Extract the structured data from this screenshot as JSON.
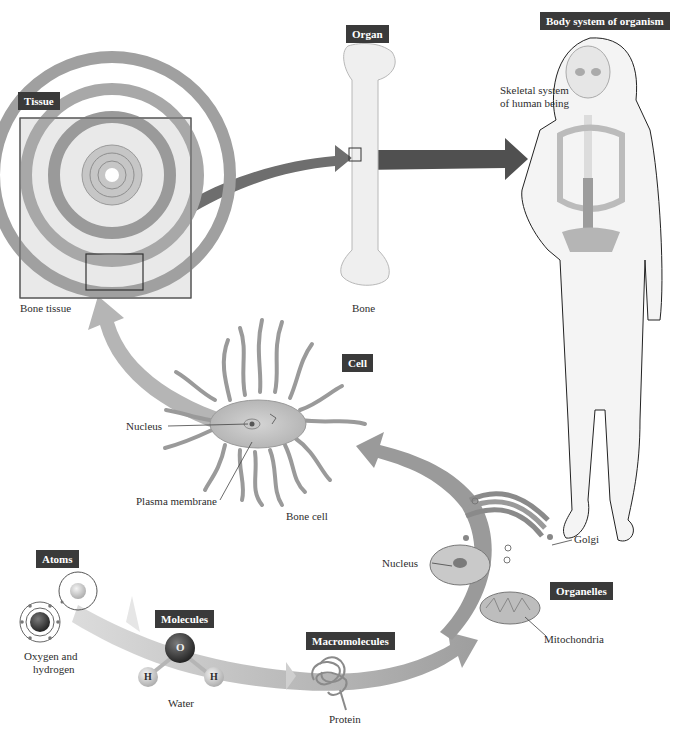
{
  "diagram": {
    "levels": [
      {
        "tag": "Atoms",
        "example": "Oxygen and\nhydrogen"
      },
      {
        "tag": "Molecules",
        "example": "Water"
      },
      {
        "tag": "Macromolecules",
        "example": "Protein"
      },
      {
        "tag": "Organelles",
        "parts": [
          "Nucleus",
          "Golgi",
          "Mitochondria"
        ]
      },
      {
        "tag": "Cell",
        "example": "Bone cell",
        "parts": [
          "Nucleus",
          "Plasma membrane"
        ]
      },
      {
        "tag": "Tissue",
        "example": "Bone tissue"
      },
      {
        "tag": "Organ",
        "example": "Bone"
      },
      {
        "tag": "Body system of organism",
        "example": "Skeletal system\nof human being"
      }
    ],
    "atom_symbols": {
      "oxygen": "O",
      "hydrogen_left": "H",
      "hydrogen_right": "H"
    },
    "colors": {
      "tag_bg": "#3a3a3a",
      "arrow_light": "#d8d8d8",
      "arrow_mid": "#a6a6a6",
      "arrow_dark": "#5a5a5a",
      "bone": "#ececec",
      "cell": "#b9b9b9"
    }
  },
  "labels": {
    "tissue_tag": "Tissue",
    "tissue_caption": "Bone tissue",
    "organ_tag": "Organ",
    "organ_caption": "Bone",
    "body_tag": "Body system of organism",
    "body_caption_1": "Skeletal system",
    "body_caption_2": "of human being",
    "cell_tag": "Cell",
    "cell_nucleus": "Nucleus",
    "cell_membrane": "Plasma membrane",
    "cell_caption": "Bone cell",
    "organelle_nucleus": "Nucleus",
    "organelle_golgi": "Golgi",
    "organelles_tag": "Organelles",
    "organelle_mito": "Mitochondria",
    "atoms_tag": "Atoms",
    "atoms_caption_1": "Oxygen and",
    "atoms_caption_2": "hydrogen",
    "molecules_tag": "Molecules",
    "molecules_caption": "Water",
    "macro_tag": "Macromolecules",
    "macro_caption": "Protein",
    "oxygen_symbol": "O",
    "hydrogen_symbol_1": "H",
    "hydrogen_symbol_2": "H"
  }
}
